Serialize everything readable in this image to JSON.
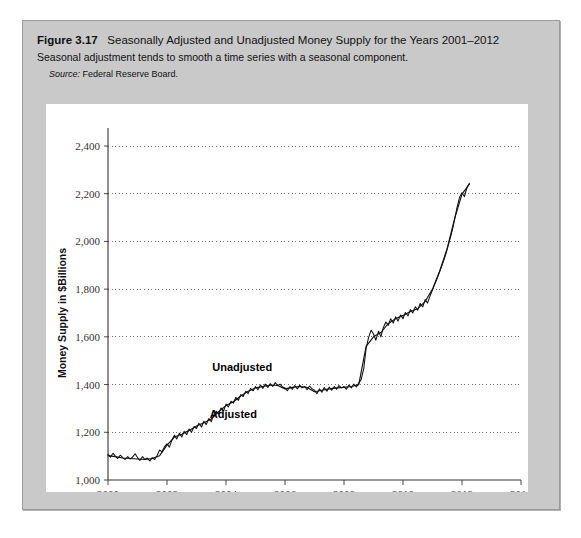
{
  "figure": {
    "label": "Figure 3.17",
    "title": "Seasonally Adjusted and Unadjusted Money Supply for the Years 2001–2012",
    "subtitle": "Seasonal adjustment tends to smooth a time series with a seasonal component.",
    "source_label": "Source:",
    "source_text": "Federal Reserve Board."
  },
  "chart_data": {
    "type": "line",
    "title": "Seasonally Adjusted and Unadjusted Money Supply for the Years 2001–2012",
    "xlabel": "Year",
    "ylabel": "Money Supply in $Billions",
    "xlim": [
      2000,
      2014
    ],
    "ylim": [
      1000,
      2400
    ],
    "xticks": [
      2000,
      2002,
      2004,
      2006,
      2008,
      2010,
      2012,
      2014
    ],
    "xtick_labels": [
      "2000",
      "2002",
      "2004",
      "2006",
      "2008",
      "2010",
      "2012",
      "2014"
    ],
    "yticks": [
      1000,
      1200,
      1400,
      1600,
      1800,
      2000,
      2200,
      2400
    ],
    "ytick_labels": [
      "1,000",
      "1,200",
      "1,400",
      "1,600",
      "1,800",
      "2,000",
      "2,200",
      "2,400"
    ],
    "grid": "horizontal-dotted",
    "legend": "inline-annotations",
    "annotations": [
      {
        "text": "Unadjusted",
        "x": 2004.55,
        "y": 1455
      },
      {
        "text": "Adjusted",
        "x": 2004.25,
        "y": 1258
      }
    ],
    "line_color": "#111111",
    "series": [
      {
        "name": "Unadjusted",
        "x": [
          2000.0,
          2000.08,
          2000.17,
          2000.25,
          2000.33,
          2000.42,
          2000.5,
          2000.58,
          2000.67,
          2000.75,
          2000.83,
          2000.92,
          2001.0,
          2001.08,
          2001.17,
          2001.25,
          2001.33,
          2001.42,
          2001.5,
          2001.58,
          2001.67,
          2001.75,
          2001.83,
          2001.92,
          2002.0,
          2002.08,
          2002.17,
          2002.25,
          2002.33,
          2002.42,
          2002.5,
          2002.58,
          2002.67,
          2002.75,
          2002.83,
          2002.92,
          2003.0,
          2003.08,
          2003.17,
          2003.25,
          2003.33,
          2003.42,
          2003.5,
          2003.58,
          2003.67,
          2003.75,
          2003.83,
          2003.92,
          2004.0,
          2004.08,
          2004.17,
          2004.25,
          2004.33,
          2004.42,
          2004.5,
          2004.58,
          2004.67,
          2004.75,
          2004.83,
          2004.92,
          2005.0,
          2005.08,
          2005.17,
          2005.25,
          2005.33,
          2005.42,
          2005.5,
          2005.58,
          2005.67,
          2005.75,
          2005.83,
          2005.92,
          2006.0,
          2006.08,
          2006.17,
          2006.25,
          2006.33,
          2006.42,
          2006.5,
          2006.58,
          2006.67,
          2006.75,
          2006.83,
          2006.92,
          2007.0,
          2007.08,
          2007.17,
          2007.25,
          2007.33,
          2007.42,
          2007.5,
          2007.58,
          2007.67,
          2007.75,
          2007.83,
          2007.92,
          2008.0,
          2008.08,
          2008.17,
          2008.25,
          2008.33,
          2008.42,
          2008.5,
          2008.58,
          2008.67,
          2008.75,
          2008.83,
          2008.92,
          2009.0,
          2009.08,
          2009.17,
          2009.25,
          2009.33,
          2009.42,
          2009.5,
          2009.58,
          2009.67,
          2009.75,
          2009.83,
          2009.92,
          2010.0,
          2010.08,
          2010.17,
          2010.25,
          2010.33,
          2010.42,
          2010.5,
          2010.58,
          2010.67,
          2010.75,
          2010.83,
          2010.92,
          2011.0,
          2011.08,
          2011.17,
          2011.25,
          2011.33,
          2011.42,
          2011.5,
          2011.58,
          2011.67,
          2011.75,
          2011.83,
          2011.92,
          2012.0,
          2012.08,
          2012.17,
          2012.25
        ],
        "y": [
          1108,
          1096,
          1112,
          1100,
          1090,
          1104,
          1094,
          1086,
          1098,
          1088,
          1096,
          1110,
          1094,
          1082,
          1098,
          1086,
          1092,
          1080,
          1094,
          1086,
          1104,
          1126,
          1118,
          1140,
          1152,
          1138,
          1168,
          1188,
          1172,
          1196,
          1180,
          1204,
          1190,
          1214,
          1200,
          1224,
          1216,
          1238,
          1222,
          1246,
          1232,
          1258,
          1244,
          1272,
          1288,
          1276,
          1302,
          1290,
          1318,
          1306,
          1330,
          1322,
          1346,
          1334,
          1358,
          1350,
          1372,
          1362,
          1384,
          1374,
          1392,
          1378,
          1398,
          1384,
          1402,
          1388,
          1404,
          1392,
          1408,
          1396,
          1402,
          1390,
          1386,
          1374,
          1392,
          1380,
          1396,
          1382,
          1398,
          1386,
          1392,
          1378,
          1394,
          1382,
          1376,
          1362,
          1382,
          1368,
          1388,
          1372,
          1390,
          1376,
          1392,
          1380,
          1396,
          1386,
          1392,
          1380,
          1398,
          1386,
          1402,
          1390,
          1406,
          1420,
          1468,
          1552,
          1596,
          1628,
          1612,
          1586,
          1624,
          1600,
          1638,
          1662,
          1648,
          1676,
          1658,
          1684,
          1666,
          1692,
          1676,
          1702,
          1688,
          1714,
          1700,
          1726,
          1712,
          1740,
          1726,
          1756,
          1742,
          1772,
          1796,
          1822,
          1848,
          1876,
          1902,
          1934,
          1968,
          2004,
          2046,
          2092,
          2142,
          2186,
          2204,
          2188,
          2226,
          2244
        ]
      },
      {
        "name": "Adjusted",
        "x": [
          2000.0,
          2000.25,
          2000.5,
          2000.75,
          2001.0,
          2001.25,
          2001.5,
          2001.75,
          2002.0,
          2002.25,
          2002.5,
          2002.75,
          2003.0,
          2003.25,
          2003.5,
          2003.75,
          2004.0,
          2004.25,
          2004.5,
          2004.75,
          2005.0,
          2005.25,
          2005.5,
          2005.75,
          2006.0,
          2006.25,
          2006.5,
          2006.75,
          2007.0,
          2007.25,
          2007.5,
          2007.75,
          2008.0,
          2008.25,
          2008.5,
          2008.75,
          2009.0,
          2009.25,
          2009.5,
          2009.75,
          2010.0,
          2010.25,
          2010.5,
          2010.75,
          2011.0,
          2011.25,
          2011.5,
          2011.75,
          2012.0,
          2012.25
        ],
        "y": [
          1102,
          1098,
          1092,
          1090,
          1088,
          1086,
          1090,
          1102,
          1146,
          1180,
          1192,
          1208,
          1226,
          1240,
          1256,
          1286,
          1312,
          1328,
          1352,
          1372,
          1386,
          1392,
          1398,
          1396,
          1382,
          1388,
          1392,
          1388,
          1370,
          1376,
          1382,
          1386,
          1388,
          1392,
          1400,
          1560,
          1600,
          1618,
          1656,
          1676,
          1690,
          1706,
          1718,
          1748,
          1800,
          1878,
          1972,
          2096,
          2198,
          2240
        ]
      }
    ]
  }
}
